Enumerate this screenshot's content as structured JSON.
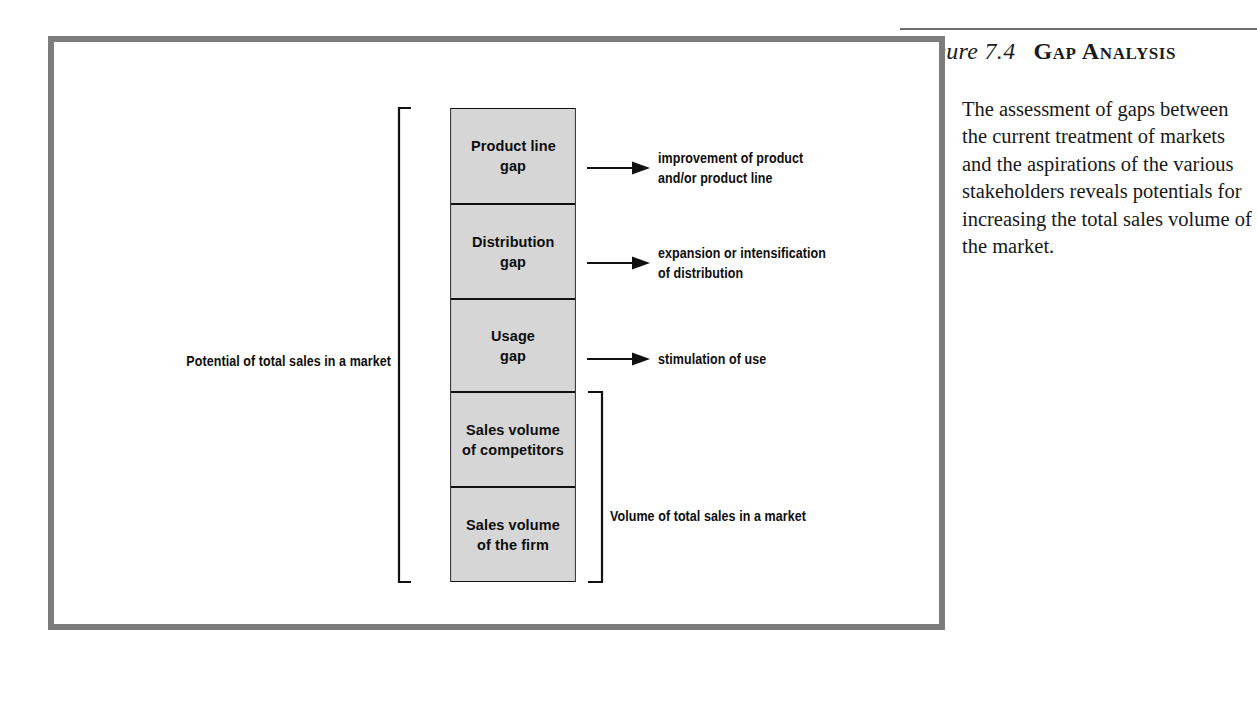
{
  "figure": {
    "number": "Figure 7.4",
    "title": "Gap Analysis"
  },
  "description": "The assessment of gaps between the current treatment of markets and the aspirations of the various stakeholders reveals potentials for increasing the total sales volume of the market.",
  "diagram": {
    "left_bracket_label": "Potential of total sales in a market",
    "right_bracket_label": "Volume of total sales in a market",
    "boxes": [
      {
        "line1": "Product line",
        "line2": "gap"
      },
      {
        "line1": "Distribution",
        "line2": "gap"
      },
      {
        "line1": "Usage",
        "line2": "gap"
      },
      {
        "line1": "Sales volume",
        "line2": "of competitors"
      },
      {
        "line1": "Sales volume",
        "line2": "of the firm"
      }
    ],
    "callouts": [
      "improvement of product\nand/or product line",
      "expansion or intensification\nof distribution",
      "stimulation of use"
    ]
  },
  "colors": {
    "frame": "#7c7c7c",
    "box_fill": "#d6d6d6",
    "box_stroke": "#111111",
    "rule": "#6d6d6d",
    "text": "#0d0d0d"
  }
}
